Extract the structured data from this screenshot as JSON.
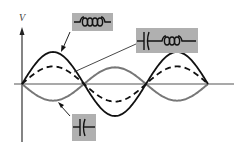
{
  "diagram": {
    "type": "waveform-diagram",
    "axes": {
      "y_label": "V"
    },
    "curves": [
      {
        "name": "inductor-voltage",
        "style": "solid",
        "color": "#111111",
        "amplitude": 1.0,
        "phase": "in-phase",
        "half_cycles": 3
      },
      {
        "name": "lc-combined-voltage",
        "style": "dashed",
        "color": "#111111",
        "amplitude": 0.55,
        "phase": "in-phase",
        "half_cycles": 3
      },
      {
        "name": "capacitor-voltage",
        "style": "solid",
        "color": "#777777",
        "amplitude": 0.52,
        "phase": "inverted",
        "half_cycles": 3
      }
    ],
    "labels": [
      {
        "name": "inductor-label",
        "symbol": "inductor",
        "points_to": "inductor-voltage"
      },
      {
        "name": "lc-series-label",
        "symbol": "capacitor+inductor",
        "points_to": "lc-combined-voltage"
      },
      {
        "name": "capacitor-label",
        "symbol": "capacitor",
        "points_to": "capacitor-voltage"
      }
    ],
    "colors": {
      "label_box": "#b0b0b0",
      "axis": "#555555",
      "symbol": "#111111"
    }
  }
}
